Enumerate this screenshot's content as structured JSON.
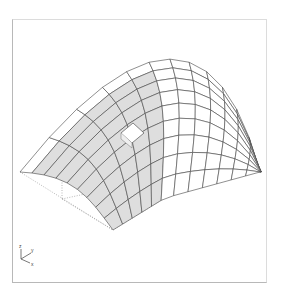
{
  "viewport": {
    "frame_color": "#b8b8b8",
    "background": "#ffffff"
  },
  "surface": {
    "type": "parabolic-saddle-mesh",
    "grid_u": 12,
    "grid_v": 9,
    "shaded_columns_upto": 5,
    "mesh_color": "#444444",
    "lit_fill": "#ffffff",
    "shaded_fill": "#dedede",
    "corners": {
      "back_left": [
        20,
        172
      ],
      "back_peak": [
        150,
        62
      ],
      "back_right": [
        260,
        172
      ],
      "front_left": [
        113,
        230
      ],
      "front_right": [
        165,
        198
      ]
    }
  },
  "selected_patch": {
    "label": "highlighted-element",
    "fill": "#ffffff"
  },
  "bounding_box": {
    "style": "dotted",
    "color": "#888888"
  },
  "axis_triad": {
    "labels": {
      "z": "z",
      "y": "y",
      "x": "x"
    }
  }
}
